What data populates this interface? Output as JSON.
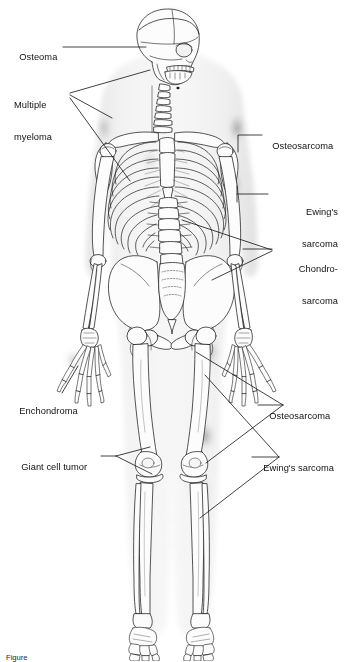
{
  "figure": {
    "background_color": "#ffffff",
    "line_color": "#1a1a1a",
    "silhouette_color": "#ebebeb",
    "bone_fill": "#fbfbfb",
    "tumor_shadow_color": "#4a4a4a",
    "view": "anterior full-body skeleton"
  },
  "labels": [
    {
      "id": "osteoma",
      "text": "Osteoma",
      "lines": [
        "Osteoma"
      ],
      "side": "left",
      "target": "skull (frontal/parietal)"
    },
    {
      "id": "multiple-myeloma",
      "text": "Multiple myeloma",
      "lines": [
        "Multiple",
        "myeloma"
      ],
      "side": "left",
      "target": "skull, clavicle, ribs"
    },
    {
      "id": "enchondroma",
      "text": "Enchondroma",
      "lines": [
        "Enchondroma"
      ],
      "side": "left",
      "target": "hand phalanges"
    },
    {
      "id": "giant-cell-tumor",
      "text": "Giant cell tumor",
      "lines": [
        "Giant cell tumor"
      ],
      "side": "left",
      "target": "distal femur / proximal tibia"
    },
    {
      "id": "osteosarcoma-upper",
      "text": "Osteosarcoma",
      "lines": [
        "Osteosarcoma"
      ],
      "side": "right",
      "target": "proximal humerus"
    },
    {
      "id": "ewings-sarcoma-upper",
      "text": "Ewing's sarcoma",
      "lines": [
        "Ewing's",
        "sarcoma"
      ],
      "side": "right",
      "target": "humerus shaft"
    },
    {
      "id": "chondrosarcoma",
      "text": "Chondro-sarcoma",
      "lines": [
        "Chondro-",
        "sarcoma"
      ],
      "side": "right",
      "target": "pelvis, ribs, proximal humerus"
    },
    {
      "id": "osteosarcoma-lower",
      "text": "Osteosarcoma",
      "lines": [
        "Osteosarcoma"
      ],
      "side": "right",
      "target": "distal femur / proximal tibia"
    },
    {
      "id": "ewings-sarcoma-lower",
      "text": "Ewing's sarcoma",
      "lines": [
        "Ewing's sarcoma"
      ],
      "side": "right",
      "target": "femur shaft / tibia shaft"
    }
  ],
  "caption": {
    "visible": true,
    "clipped": true,
    "text": "Figure"
  }
}
